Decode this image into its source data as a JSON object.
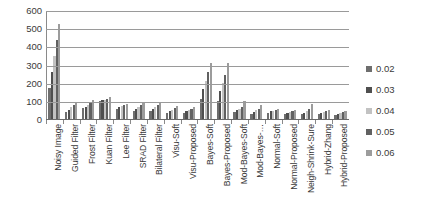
{
  "chart_data": {
    "type": "bar",
    "title": "",
    "xlabel": "",
    "ylabel": "",
    "ylim": [
      0,
      600
    ],
    "ytick_labels": [
      "600",
      "500",
      "400",
      "300",
      "200",
      "100",
      "0"
    ],
    "ytick_values": [
      600,
      500,
      400,
      300,
      200,
      100,
      0
    ],
    "grid": true,
    "legend_position": "right",
    "legend_title": "",
    "categories": [
      "Noisy Image",
      "Guided Filter",
      "Frost Filter",
      "Kuan Filter",
      "Lee Filter",
      "SRAD Filter",
      "Bilateral Filter",
      "Visu-Soft",
      "Visu-Proposed",
      "Bayes-Soft",
      "Bayes-Proposed",
      "Mod-Bayes-Soft",
      "Mod-Bayes-…",
      "Normal-Soft",
      "Normal-Proposed",
      "Neigh-Shrink-Sure",
      "Hybrid-Zhang",
      "Hybrid-Proposed"
    ],
    "series": [
      {
        "name": "0.02",
        "color": "#6e6e6e",
        "values": [
          175,
          38,
          62,
          98,
          58,
          42,
          46,
          35,
          32,
          110,
          100,
          38,
          30,
          36,
          28,
          28,
          26,
          24
        ]
      },
      {
        "name": "0.03",
        "color": "#4f4f4f",
        "values": [
          260,
          52,
          68,
          103,
          64,
          55,
          55,
          42,
          42,
          165,
          155,
          48,
          38,
          42,
          34,
          36,
          34,
          30
        ]
      },
      {
        "name": "0.04",
        "color": "#c2c2c2",
        "values": [
          350,
          66,
          78,
          106,
          70,
          68,
          64,
          52,
          50,
          210,
          200,
          56,
          48,
          46,
          40,
          44,
          40,
          36
        ]
      },
      {
        "name": "0.05",
        "color": "#616161",
        "values": [
          440,
          80,
          92,
          112,
          76,
          80,
          76,
          60,
          56,
          260,
          245,
          64,
          58,
          50,
          44,
          54,
          46,
          40
        ]
      },
      {
        "name": "0.06",
        "color": "#9c9c9c",
        "values": [
          530,
          96,
          106,
          120,
          82,
          96,
          92,
          70,
          64,
          310,
          310,
          98,
          80,
          54,
          48,
          82,
          52,
          46
        ]
      }
    ]
  }
}
